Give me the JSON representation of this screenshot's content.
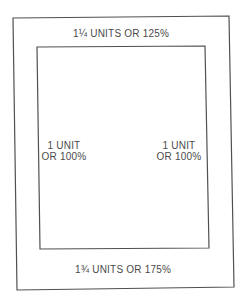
{
  "diagram": {
    "type": "proportion-margin-diagram",
    "colors": {
      "line": "#505050",
      "text": "#4a4a4a",
      "background": "#ffffff"
    },
    "labels": {
      "top": "1¼ UNITS OR 125%",
      "left_line1": "1 UNIT",
      "left_line2": "OR 100%",
      "right_line1": "1 UNIT",
      "right_line2": "OR 100%",
      "bottom": "1¾ UNITS OR 175%"
    }
  }
}
